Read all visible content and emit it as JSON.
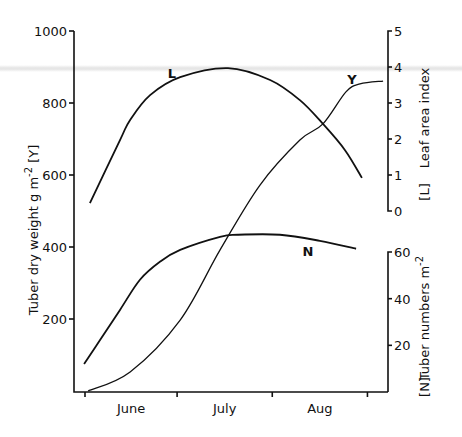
{
  "chart_data": {
    "type": "line",
    "title": "",
    "xlabel": "",
    "x_unit": "days since 1 June",
    "x_ticks": [
      0,
      30,
      61,
      92
    ],
    "x_tick_labels": [
      "June",
      "July",
      "Aug"
    ],
    "xlim": [
      -3,
      98
    ],
    "axes": {
      "left": {
        "label": "Tuber dry weight  g m",
        "label_sup": "-2",
        "tag": "[Y]",
        "ticks": [
          200,
          400,
          600,
          800,
          1000
        ],
        "ylim": [
          0,
          1000
        ]
      },
      "right_upper": {
        "label": "Leaf area index",
        "tag": "[L]",
        "ticks": [
          0,
          1,
          2,
          3,
          4,
          5
        ],
        "ylim": [
          0,
          5
        ]
      },
      "right_lower": {
        "label": "Tuber numbers m",
        "label_sup": "-2",
        "tag": "[N]",
        "ticks": [
          20,
          40,
          60
        ],
        "ylim": [
          0,
          60
        ]
      }
    },
    "series": [
      {
        "name": "L",
        "axis": "right_upper",
        "label": "L",
        "x": [
          1.6,
          11.4,
          14.7,
          21.2,
          31.0,
          46.6,
          60.3,
          70.0,
          77.5,
          84.7,
          90.2
        ],
        "y": [
          0.22,
          1.97,
          2.53,
          3.22,
          3.72,
          3.97,
          3.64,
          3.08,
          2.42,
          1.69,
          0.92
        ]
      },
      {
        "name": "Y",
        "axis": "left",
        "label": "Y",
        "x": [
          1.0,
          14.7,
          31.0,
          44.0,
          57.0,
          70.0,
          77.5,
          85.0,
          89.6,
          97.1
        ],
        "y": [
          0,
          53,
          197,
          392,
          572,
          697,
          742,
          831,
          853,
          861
        ]
      },
      {
        "name": "N",
        "axis": "right_lower",
        "label": "N",
        "x": [
          -0.3,
          4.9,
          11.4,
          17.9,
          24.4,
          31.0,
          44.0,
          49.8,
          63.5,
          76.5,
          88.3
        ],
        "y": [
          12.0,
          22.3,
          35.2,
          48.1,
          55.8,
          60.9,
          66.5,
          67.4,
          67.4,
          64.8,
          61.4
        ]
      }
    ],
    "legend": "none (inline curve labels)",
    "grid": false
  }
}
